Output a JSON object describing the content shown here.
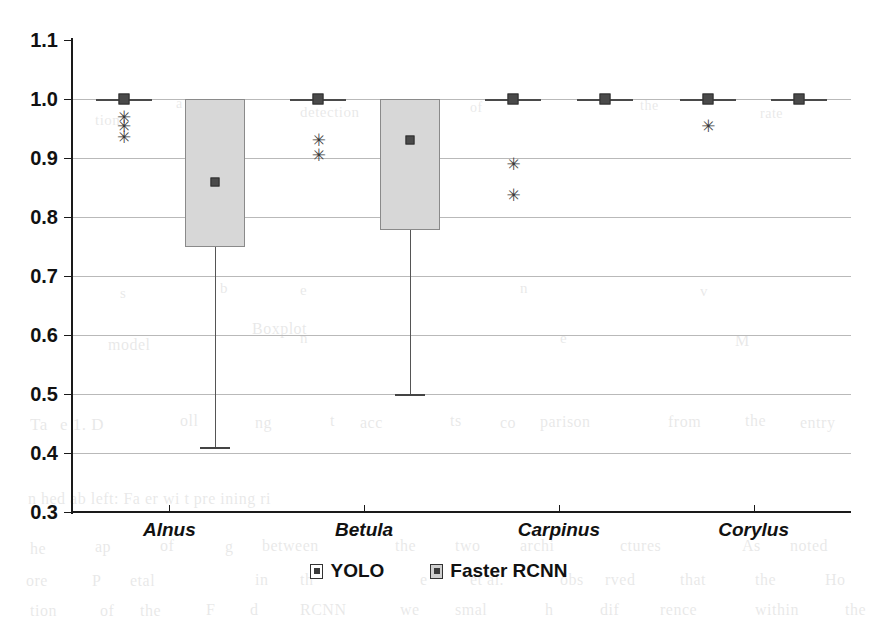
{
  "chart_data": {
    "type": "box",
    "title": "",
    "xlabel": "",
    "ylabel": "",
    "ylim": [
      0.3,
      1.1
    ],
    "ytick_step": 0.1,
    "grid": true,
    "legend_position": "bottom-center",
    "categories": [
      "Alnus",
      "Betula",
      "Carpinus",
      "Corylus"
    ],
    "ytick_labels": [
      "1.1",
      "1.0",
      "0.9",
      "0.8",
      "0.7",
      "0.6",
      "0.5",
      "0.4",
      "0.3"
    ],
    "ytick_values": [
      1.1,
      1.0,
      0.9,
      0.8,
      0.7,
      0.6,
      0.5,
      0.4,
      0.3
    ],
    "series": [
      {
        "name": "YOLO",
        "color": "#4a4a4a",
        "boxes": [
          {
            "category": "Alnus",
            "min": 1.0,
            "q1": 1.0,
            "median": 1.0,
            "q3": 1.0,
            "max": 1.0,
            "degenerate": true,
            "outliers": [
              0.97,
              0.955,
              0.935
            ]
          },
          {
            "category": "Betula",
            "min": 1.0,
            "q1": 1.0,
            "median": 1.0,
            "q3": 1.0,
            "max": 1.0,
            "degenerate": true,
            "outliers": [
              0.93,
              0.905
            ]
          },
          {
            "category": "Carpinus",
            "min": 1.0,
            "q1": 1.0,
            "median": 1.0,
            "q3": 1.0,
            "max": 1.0,
            "degenerate": true,
            "outliers": [
              0.89,
              0.838
            ]
          },
          {
            "category": "Corylus",
            "min": 1.0,
            "q1": 1.0,
            "median": 1.0,
            "q3": 1.0,
            "max": 1.0,
            "degenerate": true,
            "outliers": [
              0.955
            ]
          }
        ]
      },
      {
        "name": "Faster RCNN",
        "color": "#d7d7d7",
        "boxes": [
          {
            "category": "Alnus",
            "min": 0.41,
            "q1": 0.75,
            "median": 0.86,
            "q3": 1.0,
            "max": 1.0,
            "degenerate": false,
            "outliers": []
          },
          {
            "category": "Betula",
            "min": 0.5,
            "q1": 0.778,
            "median": 0.93,
            "q3": 1.0,
            "max": 1.0,
            "degenerate": false,
            "outliers": []
          },
          {
            "category": "Carpinus",
            "min": 1.0,
            "q1": 1.0,
            "median": 1.0,
            "q3": 1.0,
            "max": 1.0,
            "degenerate": true,
            "outliers": []
          },
          {
            "category": "Corylus",
            "min": 1.0,
            "q1": 1.0,
            "median": 1.0,
            "q3": 1.0,
            "max": 1.0,
            "degenerate": true,
            "outliers": []
          }
        ]
      }
    ]
  },
  "legend": {
    "entries": [
      {
        "label": "YOLO",
        "swatch": "yolo-swatch"
      },
      {
        "label": "Faster RCNN",
        "swatch": "rcnn-swatch"
      }
    ]
  },
  "background_text": {
    "note": "faint bleed-through text from the reverse side of the scanned page",
    "lines": [
      {
        "text": "tion",
        "x": 95,
        "y": 112,
        "size": 15
      },
      {
        "text": "a",
        "x": 176,
        "y": 96,
        "size": 14
      },
      {
        "text": "detection",
        "x": 300,
        "y": 104,
        "size": 15
      },
      {
        "text": "of",
        "x": 470,
        "y": 100,
        "size": 14
      },
      {
        "text": "the",
        "x": 640,
        "y": 98,
        "size": 14
      },
      {
        "text": "rate",
        "x": 760,
        "y": 106,
        "size": 14
      },
      {
        "text": "s",
        "x": 120,
        "y": 285,
        "size": 15
      },
      {
        "text": "b",
        "x": 220,
        "y": 280,
        "size": 15
      },
      {
        "text": "e",
        "x": 300,
        "y": 282,
        "size": 15
      },
      {
        "text": "n",
        "x": 520,
        "y": 280,
        "size": 15
      },
      {
        "text": "v",
        "x": 700,
        "y": 283,
        "size": 15
      },
      {
        "text": "model",
        "x": 108,
        "y": 336,
        "size": 16
      },
      {
        "text": "n",
        "x": 300,
        "y": 330,
        "size": 15
      },
      {
        "text": "Boxplot",
        "x": 252,
        "y": 320,
        "size": 16
      },
      {
        "text": "e",
        "x": 560,
        "y": 330,
        "size": 15
      },
      {
        "text": "M",
        "x": 735,
        "y": 332,
        "size": 16
      },
      {
        "text": "Ta",
        "x": 30,
        "y": 415,
        "size": 17
      },
      {
        "text": "e  1.  D",
        "x": 60,
        "y": 415,
        "size": 17
      },
      {
        "text": "oll",
        "x": 180,
        "y": 412,
        "size": 16
      },
      {
        "text": "ng",
        "x": 255,
        "y": 414,
        "size": 16
      },
      {
        "text": "t",
        "x": 330,
        "y": 412,
        "size": 16
      },
      {
        "text": "acc",
        "x": 360,
        "y": 414,
        "size": 16
      },
      {
        "text": "ts",
        "x": 450,
        "y": 412,
        "size": 16
      },
      {
        "text": "co",
        "x": 500,
        "y": 414,
        "size": 16
      },
      {
        "text": "parison",
        "x": 540,
        "y": 413,
        "size": 16
      },
      {
        "text": "from",
        "x": 668,
        "y": 413,
        "size": 16
      },
      {
        "text": "the",
        "x": 745,
        "y": 412,
        "size": 16
      },
      {
        "text": "entry",
        "x": 800,
        "y": 414,
        "size": 16
      },
      {
        "text": "n  hed   ab  left:  Fa  er    wi   t   pre  ining   ri",
        "x": 28,
        "y": 490,
        "size": 16
      },
      {
        "text": "he",
        "x": 30,
        "y": 540,
        "size": 16
      },
      {
        "text": "ap",
        "x": 95,
        "y": 538,
        "size": 16
      },
      {
        "text": "of",
        "x": 160,
        "y": 537,
        "size": 16
      },
      {
        "text": "g",
        "x": 225,
        "y": 538,
        "size": 16
      },
      {
        "text": "between",
        "x": 262,
        "y": 537,
        "size": 16
      },
      {
        "text": "the",
        "x": 395,
        "y": 537,
        "size": 16
      },
      {
        "text": "two",
        "x": 455,
        "y": 537,
        "size": 16
      },
      {
        "text": "archi",
        "x": 520,
        "y": 537,
        "size": 16
      },
      {
        "text": "ctures",
        "x": 620,
        "y": 537,
        "size": 16
      },
      {
        "text": "As",
        "x": 742,
        "y": 537,
        "size": 16
      },
      {
        "text": "noted",
        "x": 790,
        "y": 537,
        "size": 16
      },
      {
        "text": "ore",
        "x": 26,
        "y": 572,
        "size": 16
      },
      {
        "text": "P",
        "x": 92,
        "y": 572,
        "size": 16
      },
      {
        "text": "etal",
        "x": 130,
        "y": 572,
        "size": 16
      },
      {
        "text": "in",
        "x": 255,
        "y": 571,
        "size": 16
      },
      {
        "text": "th",
        "x": 300,
        "y": 571,
        "size": 16
      },
      {
        "text": "e",
        "x": 420,
        "y": 571,
        "size": 16
      },
      {
        "text": "et al.",
        "x": 470,
        "y": 571,
        "size": 16
      },
      {
        "text": "obs",
        "x": 560,
        "y": 571,
        "size": 16
      },
      {
        "text": "rved",
        "x": 605,
        "y": 571,
        "size": 16
      },
      {
        "text": "that",
        "x": 680,
        "y": 571,
        "size": 16
      },
      {
        "text": "the",
        "x": 755,
        "y": 571,
        "size": 16
      },
      {
        "text": "Ho",
        "x": 825,
        "y": 571,
        "size": 16
      },
      {
        "text": "tion",
        "x": 30,
        "y": 602,
        "size": 16
      },
      {
        "text": "of",
        "x": 100,
        "y": 602,
        "size": 16
      },
      {
        "text": "the",
        "x": 140,
        "y": 602,
        "size": 16
      },
      {
        "text": "F",
        "x": 206,
        "y": 601,
        "size": 16
      },
      {
        "text": "d",
        "x": 250,
        "y": 601,
        "size": 16
      },
      {
        "text": "RCNN",
        "x": 300,
        "y": 601,
        "size": 16
      },
      {
        "text": "we",
        "x": 400,
        "y": 601,
        "size": 16
      },
      {
        "text": "smal",
        "x": 455,
        "y": 601,
        "size": 16
      },
      {
        "text": "h",
        "x": 545,
        "y": 601,
        "size": 16
      },
      {
        "text": "dif",
        "x": 600,
        "y": 601,
        "size": 16
      },
      {
        "text": "rence",
        "x": 660,
        "y": 601,
        "size": 16
      },
      {
        "text": "within",
        "x": 755,
        "y": 601,
        "size": 16
      },
      {
        "text": "the",
        "x": 845,
        "y": 601,
        "size": 16
      }
    ]
  }
}
